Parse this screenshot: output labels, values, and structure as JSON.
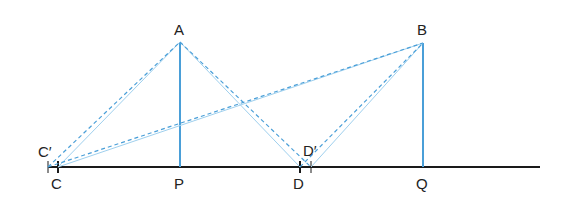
{
  "diagram": {
    "colors": {
      "baseline": "#1a1a1a",
      "blue": "#4a9fd8",
      "light_blue": "#9fd0ee"
    },
    "points": {
      "A": {
        "label": "A",
        "x": 180,
        "y": 42
      },
      "B": {
        "label": "B",
        "x": 423,
        "y": 43
      },
      "P": {
        "label": "P",
        "x": 180,
        "y": 167
      },
      "Q": {
        "label": "Q",
        "x": 423,
        "y": 167
      },
      "C": {
        "label": "C",
        "x": 58,
        "y": 167
      },
      "C_prime": {
        "label": "C′",
        "x": 48,
        "y": 167
      },
      "D": {
        "label": "D",
        "x": 300,
        "y": 167
      },
      "D_prime": {
        "label": "D′",
        "x": 311,
        "y": 167
      }
    }
  }
}
